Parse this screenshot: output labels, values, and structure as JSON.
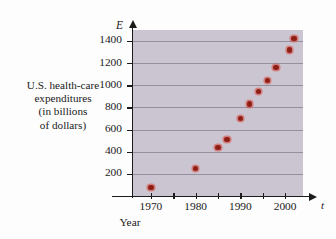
{
  "figure": {
    "background_color": "#fdfdfd",
    "plot_background_color": "#cbc5d1",
    "grid_color": "#8b8795",
    "point_color": "#8e1f16",
    "point_halo_color": "#d6564c",
    "axis_color": "#1b1b1b"
  },
  "axis_symbols": {
    "vertical": "E",
    "horizontal": "t"
  },
  "chart_data": {
    "type": "scatter",
    "title": "",
    "subtitle": "",
    "xlabel": "Year",
    "ylabel": "U.S. health-care expenditures (in billions of dollars)",
    "ylabel_lines": [
      "U.S. health-care",
      "expenditures",
      "(in billions",
      "of dollars)"
    ],
    "xlim": [
      1966,
      2004
    ],
    "ylim": [
      0,
      1500
    ],
    "grid": true,
    "legend": null,
    "legend_position": "none",
    "yticks": [
      200,
      400,
      600,
      800,
      1000,
      1200,
      1400
    ],
    "ytick_labels": [
      "200",
      "400",
      "600",
      "800",
      "1000",
      "1200",
      "1400"
    ],
    "xticks": [
      1970,
      1975,
      1980,
      1985,
      1990,
      1995,
      2000
    ],
    "xtick_labels": [
      "1970",
      "",
      "1980",
      "",
      "1990",
      "",
      "2000"
    ],
    "x": [
      1970,
      1980,
      1985,
      1987,
      1990,
      1992,
      1994,
      1996,
      1998,
      2001
    ],
    "y": [
      75,
      250,
      440,
      510,
      700,
      830,
      945,
      1045,
      1160,
      1320
    ],
    "points": [
      {
        "x": 1970,
        "y": 75
      },
      {
        "x": 1980,
        "y": 250
      },
      {
        "x": 1985,
        "y": 440
      },
      {
        "x": 1987,
        "y": 510
      },
      {
        "x": 1990,
        "y": 700
      },
      {
        "x": 1992,
        "y": 830
      },
      {
        "x": 1994,
        "y": 945
      },
      {
        "x": 1996,
        "y": 1045
      },
      {
        "x": 1998,
        "y": 1160
      },
      {
        "x": 2001,
        "y": 1320
      },
      {
        "x": 2002,
        "y": 1425
      }
    ]
  }
}
